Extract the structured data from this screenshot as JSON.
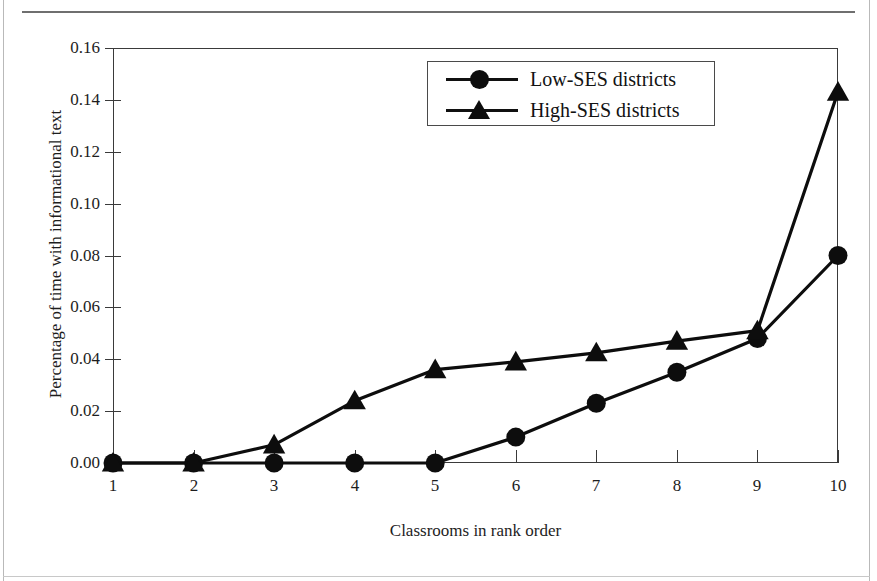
{
  "figure": {
    "caption_fragment": "",
    "background_color": "#ffffff",
    "frame_color": "#3a3a3a"
  },
  "legend": {
    "position": "top-center-right",
    "entries": [
      {
        "label": "Low-SES districts",
        "marker": "circle-marker-icon",
        "color": "#0d0d0d"
      },
      {
        "label": "High-SES districts",
        "marker": "triangle-marker-icon",
        "color": "#0d0d0d"
      }
    ]
  },
  "axes": {
    "y_ticks": [
      "0.00",
      "0.02",
      "0.04",
      "0.06",
      "0.08",
      "0.10",
      "0.12",
      "0.14",
      "0.16"
    ],
    "x_ticks": [
      "1",
      "2",
      "3",
      "4",
      "5",
      "6",
      "7",
      "8",
      "9",
      "10"
    ],
    "x_title": "Classrooms in rank order",
    "y_title": "Percentage of time with informational text"
  },
  "chart_data": {
    "type": "line",
    "title": "",
    "subtitle": "",
    "xlabel": "Classrooms in rank order",
    "ylabel": "Percentage of time with informational text",
    "x": [
      1,
      2,
      3,
      4,
      5,
      6,
      7,
      8,
      9,
      10
    ],
    "xlim": [
      1,
      10
    ],
    "ylim": [
      0.0,
      0.16
    ],
    "ytick_values": [
      0.0,
      0.02,
      0.04,
      0.06,
      0.08,
      0.1,
      0.12,
      0.14,
      0.16
    ],
    "grid": false,
    "legend_position": "upper center",
    "series": [
      {
        "name": "Low-SES districts",
        "marker": "circle",
        "color": "#0d0d0d",
        "values": [
          0.0,
          0.0,
          0.0,
          0.0,
          0.0,
          0.01,
          0.023,
          0.035,
          0.048,
          0.08
        ]
      },
      {
        "name": "High-SES districts",
        "marker": "triangle",
        "color": "#0d0d0d",
        "values": [
          0.0,
          0.0,
          0.007,
          0.024,
          0.036,
          0.039,
          0.0425,
          0.047,
          0.051,
          0.143
        ]
      }
    ]
  }
}
